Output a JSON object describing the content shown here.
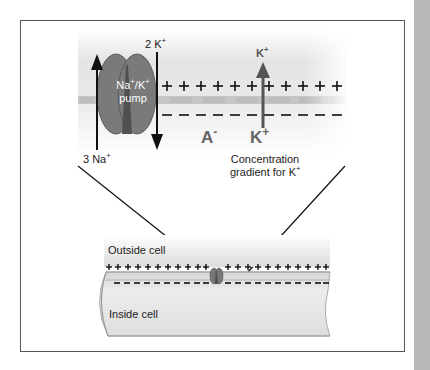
{
  "diagram": {
    "pump": {
      "label_line1": "Na",
      "label_line1_sup": "+",
      "label_line1b": "/K",
      "label_line1b_sup": "+",
      "label_line2": "pump",
      "color": "#7a7a7a",
      "core_color": "#4f4f4f"
    },
    "k_in_label": {
      "count": "2 K",
      "sup": "+"
    },
    "na_out_label": {
      "count": "3 Na",
      "sup": "+"
    },
    "k_gradient_top": {
      "text": "K",
      "sup": "+"
    },
    "k_gradient_bottom": {
      "text": "K",
      "sup": "+"
    },
    "anion_label": {
      "text": "A",
      "sup": "-"
    },
    "gradient_caption": {
      "line1": "Concentration",
      "line2": "gradient for K",
      "sup": "+"
    },
    "cell": {
      "outside_label": "Outside cell",
      "inside_label": "Inside cell"
    },
    "upper_charges": {
      "positive": "+ + + + + + + + + + +",
      "negative": "– – – – – – – – – – –"
    },
    "lower_charges": {
      "positive_left": "+ + + + + + + + + + +",
      "positive_right": "+ + + + + + + + + + + +",
      "negative_left": "– – – – – – – – – –",
      "negative_right": "– – – – – – – – – – – –"
    },
    "colors": {
      "membrane_band": "#bdbdbd",
      "arrow": "#111111",
      "k_arrow": "#555555",
      "cell_fill": "#e2e2e2",
      "frame_border": "#555555",
      "side_bar": "#b8b8b8"
    }
  }
}
